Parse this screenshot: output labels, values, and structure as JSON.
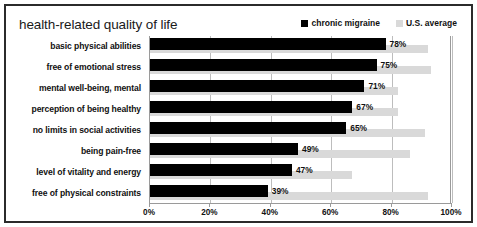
{
  "chart_data": {
    "type": "bar",
    "title": "health-related quality of life",
    "orientation": "horizontal",
    "xlabel": "",
    "ylabel": "",
    "xlim": [
      0,
      100
    ],
    "xticks": [
      "0%",
      "20%",
      "40%",
      "60%",
      "80%",
      "100%"
    ],
    "xtick_values": [
      0,
      20,
      40,
      60,
      80,
      100
    ],
    "grid": true,
    "legend_position": "top-right",
    "categories": [
      "basic physical abilities",
      "free of emotional stress",
      "mental well-being, mental",
      "perception of being healthy",
      "no limits in social activities",
      "being pain-free",
      "level of vitality and energy",
      "free of physical constraints"
    ],
    "series": [
      {
        "name": "chronic migraine",
        "color": "#000000",
        "values": [
          78,
          75,
          71,
          67,
          65,
          49,
          47,
          39
        ],
        "labels": [
          "78%",
          "75%",
          "71%",
          "67%",
          "65%",
          "49%",
          "47%",
          "39%"
        ]
      },
      {
        "name": "U.S. average",
        "color": "#d9d9d9",
        "values": [
          92,
          93,
          82,
          82,
          91,
          86,
          67,
          92
        ],
        "labels": [
          "",
          "",
          "",
          "",
          "",
          "",
          "",
          ""
        ]
      }
    ]
  },
  "colors": {
    "series_primary": "#000000",
    "series_secondary": "#d9d9d9",
    "frame": "#2b2b2b",
    "gridline": "#bdbdbd",
    "text": "#111111"
  }
}
